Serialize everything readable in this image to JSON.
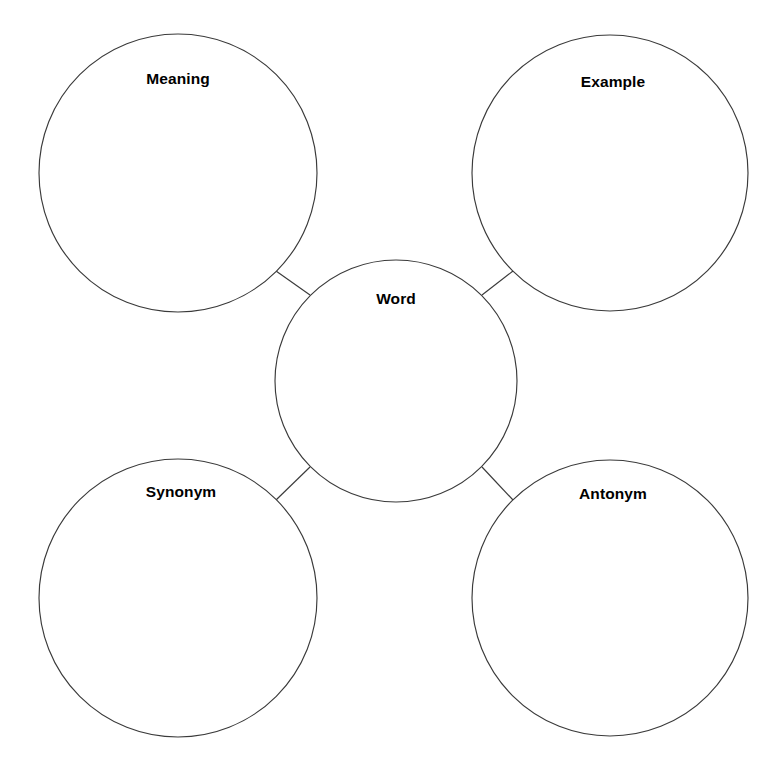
{
  "page": {
    "background_color": "#ffffff",
    "stroke_color": "#3a3a3a",
    "text_color": "#000000",
    "width": 766,
    "height": 763
  },
  "diagram": {
    "type": "bubble-map",
    "center": {
      "id": "word",
      "label": "Word",
      "cx": 396,
      "cy": 381,
      "r": 121,
      "label_x": 396,
      "label_y": 299
    },
    "nodes": [
      {
        "id": "meaning",
        "label": "Meaning",
        "cx": 178,
        "cy": 173,
        "r": 139,
        "label_x": 178,
        "label_y": 79,
        "position": "top-left"
      },
      {
        "id": "example",
        "label": "Example",
        "cx": 610,
        "cy": 173,
        "r": 138,
        "label_x": 613,
        "label_y": 82,
        "position": "top-right"
      },
      {
        "id": "synonym",
        "label": "Synonym",
        "cx": 178,
        "cy": 598,
        "r": 139,
        "label_x": 181,
        "label_y": 492,
        "position": "bottom-left"
      },
      {
        "id": "antonym",
        "label": "Antonym",
        "cx": 610,
        "cy": 598,
        "r": 138,
        "label_x": 613,
        "label_y": 494,
        "position": "bottom-right"
      }
    ],
    "connectors": [
      {
        "id": "meaning-word",
        "from": "meaning",
        "to": "word",
        "x1": 276,
        "y1": 271,
        "x2": 310,
        "y2": 295
      },
      {
        "id": "example-word",
        "from": "example",
        "to": "word",
        "x1": 513,
        "y1": 271,
        "x2": 482,
        "y2": 295
      },
      {
        "id": "synonym-word",
        "from": "synonym",
        "to": "word",
        "x1": 276,
        "y1": 500,
        "x2": 310,
        "y2": 467
      },
      {
        "id": "antonym-word",
        "from": "antonym",
        "to": "word",
        "x1": 513,
        "y1": 500,
        "x2": 482,
        "y2": 467
      }
    ]
  }
}
